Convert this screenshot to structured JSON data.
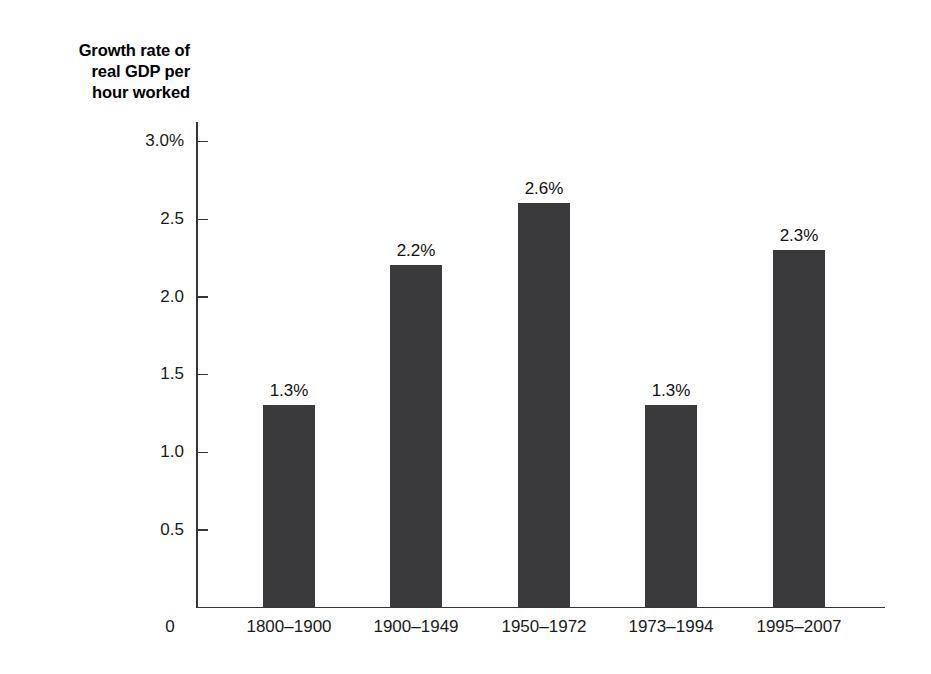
{
  "chart_data": {
    "type": "bar",
    "title": "Growth rate of real GDP per hour worked",
    "title_lines": [
      "Growth rate of",
      "real GDP per",
      "hour worked"
    ],
    "xlabel": "",
    "ylabel": "Growth rate of real GDP per hour worked",
    "categories": [
      "1800–1900",
      "1900–1949",
      "1950–1972",
      "1973–1994",
      "1995–2007"
    ],
    "values": [
      1.3,
      2.2,
      2.6,
      1.3,
      2.3
    ],
    "data_labels": [
      "1.3%",
      "2.2%",
      "2.6%",
      "1.3%",
      "2.3%"
    ],
    "ylim": [
      0,
      3.0
    ],
    "y_ticks": [
      0.5,
      1.0,
      1.5,
      2.0,
      2.5,
      3.0
    ],
    "y_tick_labels": [
      "0.5",
      "1.0",
      "1.5",
      "2.0",
      "2.5",
      "3.0%"
    ],
    "origin_label": "0",
    "grid": false,
    "legend": null,
    "bar_color": "#3a3a3c",
    "axis_color": "#33363a",
    "background_color": "#ffffff"
  }
}
